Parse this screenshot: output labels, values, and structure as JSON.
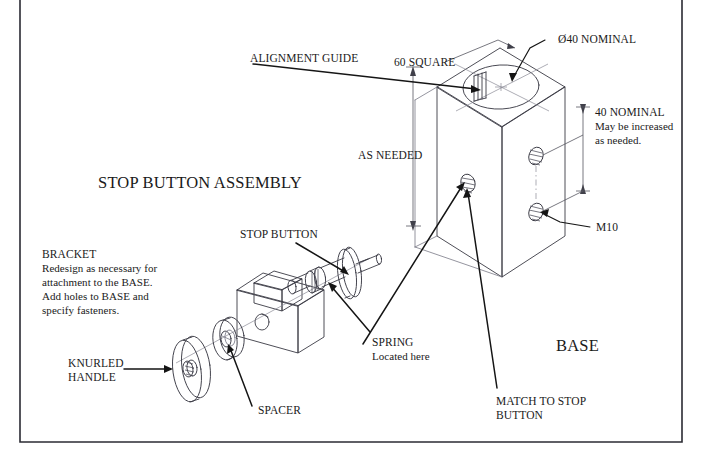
{
  "document": {
    "title": "STOP BUTTON ASSEMBLY",
    "kind": "engineering-assembly-drawing"
  },
  "labels": {
    "title": "STOP BUTTON ASSEMBLY",
    "alignment_guide": "ALIGNMENT GUIDE",
    "sixty_square": "60 SQUARE",
    "diameter_nominal": "Ø40 NOMINAL",
    "as_needed": "AS NEEDED",
    "forty_nominal_line1": "40 NOMINAL",
    "forty_nominal_line2": "May be increased",
    "forty_nominal_line3": "as needed.",
    "m10": "M10",
    "base": "BASE",
    "stop_button": "STOP BUTTON",
    "spring_line1": "SPRING",
    "spring_line2": "Located here",
    "match_line1": "MATCH TO STOP",
    "match_line2": "BUTTON",
    "spacer": "SPACER",
    "knurled_line1": "KNURLED",
    "knurled_line2": "HANDLE",
    "bracket_line1": "BRACKET",
    "bracket_line2": "Redesign as necessary for",
    "bracket_line3": "attachment to the BASE.",
    "bracket_line4": "Add holes to BASE and",
    "bracket_line5": "specify fasteners."
  },
  "colors": {
    "ink": "#1a1a1a",
    "object_line": "#3a3a44",
    "faint_line": "#7a7a86",
    "leader": "#151515",
    "border": "#2b2b33",
    "paper": "#ffffff"
  }
}
